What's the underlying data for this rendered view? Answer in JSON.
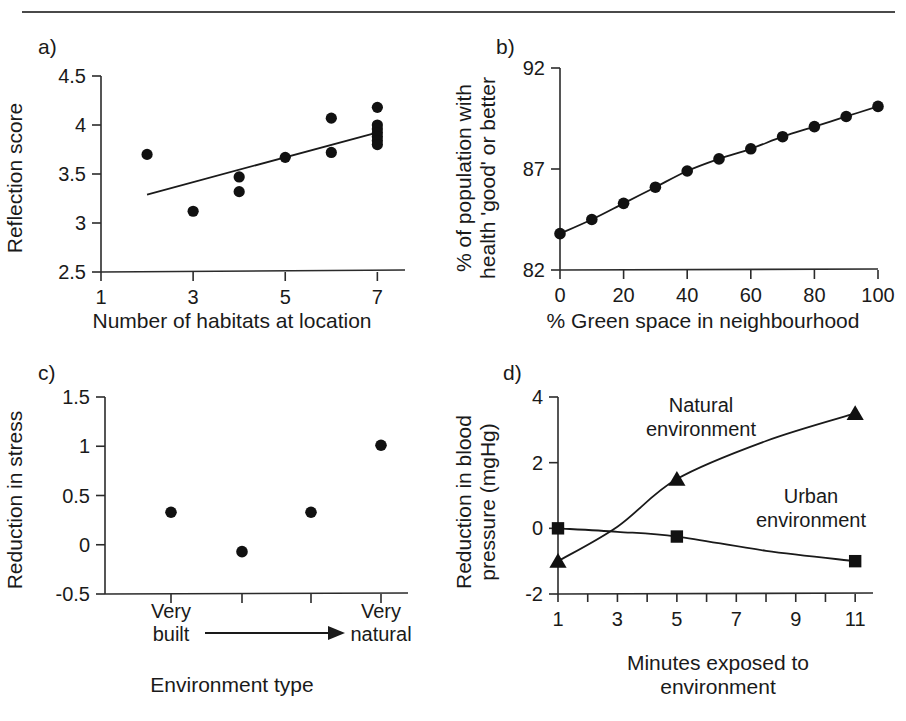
{
  "figure": {
    "rule_color": "#4a4a4a",
    "marker_color": "#111111"
  },
  "panels": {
    "a": {
      "tag": "a)",
      "ylabel": "Reflection score",
      "xlabel": "Number of habitats at location",
      "yticks": [
        "2.5",
        "3",
        "3.5",
        "4",
        "4.5"
      ],
      "xticks": [
        "1",
        "3",
        "5",
        "7"
      ]
    },
    "b": {
      "tag": "b)",
      "ylabel_line1": "% of population with",
      "ylabel_line2": "health 'good' or better",
      "xlabel": "% Green space in neighbourhood",
      "yticks": [
        "82",
        "87",
        "92"
      ],
      "xticks": [
        "0",
        "20",
        "40",
        "60",
        "80",
        "100"
      ]
    },
    "c": {
      "tag": "c)",
      "ylabel": "Reduction in stress",
      "xlabel": "Environment type",
      "yticks": [
        "-0.5",
        "0",
        "0.5",
        "1",
        "1.5"
      ],
      "cat_left_line1": "Very",
      "cat_left_line2": "built",
      "cat_right_line1": "Very",
      "cat_right_line2": "natural"
    },
    "d": {
      "tag": "d)",
      "ylabel_line1": "Reduction in blood",
      "ylabel_line2": "pressure (mgHg)",
      "xlabel_line1": "Minutes exposed to",
      "xlabel_line2": "environment",
      "yticks": [
        "-2",
        "0",
        "2",
        "4"
      ],
      "xticks": [
        "1",
        "3",
        "5",
        "7",
        "9",
        "11"
      ],
      "label_natural_line1": "Natural",
      "label_natural_line2": "environment",
      "label_urban_line1": "Urban",
      "label_urban_line2": "environment"
    }
  },
  "chart_data": [
    {
      "panel": "a",
      "type": "scatter",
      "title": "Reflection score vs number of habitats",
      "xlabel": "Number of habitats at location",
      "ylabel": "Reflection score",
      "xlim": [
        1,
        7.6
      ],
      "ylim": [
        2.5,
        4.5
      ],
      "xticks": [
        1,
        3,
        5,
        7
      ],
      "yticks": [
        2.5,
        3,
        3.5,
        4,
        4.5
      ],
      "grid": false,
      "points": [
        {
          "x": 2.0,
          "y": 3.7
        },
        {
          "x": 3.0,
          "y": 3.12
        },
        {
          "x": 4.0,
          "y": 3.47
        },
        {
          "x": 4.0,
          "y": 3.32
        },
        {
          "x": 5.0,
          "y": 3.67
        },
        {
          "x": 6.0,
          "y": 4.07
        },
        {
          "x": 6.0,
          "y": 3.72
        },
        {
          "x": 7.0,
          "y": 4.18
        },
        {
          "x": 7.0,
          "y": 4.0
        },
        {
          "x": 7.0,
          "y": 3.96
        },
        {
          "x": 7.0,
          "y": 3.92
        },
        {
          "x": 7.0,
          "y": 3.88
        },
        {
          "x": 7.0,
          "y": 3.84
        },
        {
          "x": 7.0,
          "y": 3.8
        }
      ],
      "trendline": {
        "x0": 2.0,
        "y0": 3.29,
        "x1": 7.05,
        "y1": 3.93
      }
    },
    {
      "panel": "b",
      "type": "line",
      "title": "Self-reported health vs green space",
      "xlabel": "% Green space in neighbourhood",
      "ylabel": "% of population with health 'good' or better",
      "xlim": [
        0,
        100
      ],
      "ylim": [
        82,
        92
      ],
      "xticks": [
        0,
        20,
        40,
        60,
        80,
        100
      ],
      "yticks": [
        82,
        87,
        92
      ],
      "grid": false,
      "markers": "circle",
      "x": [
        0,
        10,
        20,
        30,
        40,
        50,
        60,
        70,
        80,
        90,
        100
      ],
      "values": [
        83.8,
        84.5,
        85.3,
        86.1,
        86.9,
        87.5,
        88.0,
        88.6,
        89.1,
        89.6,
        90.1
      ]
    },
    {
      "panel": "c",
      "type": "scatter",
      "title": "Reduction in stress by environment type",
      "xlabel": "Environment type",
      "ylabel": "Reduction in stress",
      "ylim": [
        -0.5,
        1.5
      ],
      "yticks": [
        -0.5,
        0,
        0.5,
        1,
        1.5
      ],
      "grid": false,
      "categories": [
        "Very built",
        "",
        "",
        "Very natural"
      ],
      "values": [
        0.33,
        -0.07,
        0.33,
        1.01
      ]
    },
    {
      "panel": "d",
      "type": "line",
      "title": "Reduction in blood pressure over exposure time",
      "xlabel": "Minutes exposed to environment",
      "ylabel": "Reduction in blood pressure (mgHg)",
      "xlim": [
        1,
        11.6
      ],
      "ylim": [
        -2,
        4
      ],
      "xticks": [
        1,
        3,
        5,
        7,
        9,
        11
      ],
      "yticks": [
        -2,
        0,
        2,
        4
      ],
      "grid": false,
      "x": [
        1,
        5,
        11
      ],
      "series": [
        {
          "name": "Natural environment",
          "marker": "triangle",
          "values": [
            -1.0,
            1.5,
            3.5
          ]
        },
        {
          "name": "Urban environment",
          "marker": "square",
          "values": [
            0.0,
            -0.25,
            -1.0
          ]
        }
      ]
    }
  ]
}
